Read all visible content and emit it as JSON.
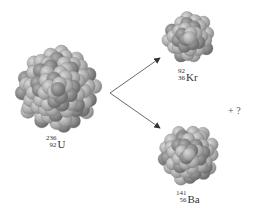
{
  "nuclei": [
    {
      "id": "uranium",
      "symbol": "U",
      "mass_number": "236",
      "atomic_number": "92",
      "cx": 58,
      "cy": 90,
      "r": 44
    },
    {
      "id": "krypton",
      "symbol": "Kr",
      "mass_number": "92",
      "atomic_number": "36",
      "cx": 189,
      "cy": 38,
      "r": 27
    },
    {
      "id": "barium",
      "symbol": "Ba",
      "mass_number": "141",
      "atomic_number": "56",
      "cx": 189,
      "cy": 155,
      "r": 32
    }
  ],
  "extra_product": "+ ?",
  "colors": {
    "nucleon_light": "#bdbdbd",
    "nucleon_dark": "#8a8a8a",
    "arrow": "#444444",
    "text": "#333333"
  }
}
